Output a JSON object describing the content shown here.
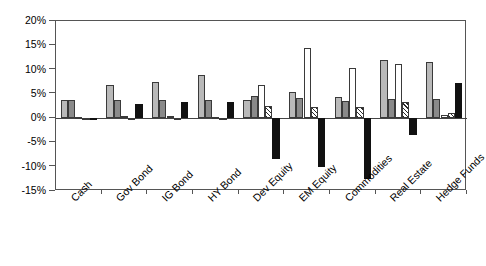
{
  "chart_data": {
    "type": "bar",
    "title": "",
    "subtitle": "",
    "xlabel": "",
    "ylabel": "",
    "ylim": [
      -15,
      20
    ],
    "ytick_values": [
      20,
      15,
      10,
      5,
      0,
      -5,
      -10,
      -15
    ],
    "ytick_labels": [
      "20%",
      "15%",
      "10%",
      "5%",
      "0%",
      "-5%",
      "-10%",
      "-15%"
    ],
    "grid": false,
    "legend": "none",
    "categories": [
      "Cash",
      "Gov Bond",
      "IG Bond",
      "HY Bond",
      "Dev Equity",
      "EM Equity",
      "Commodities",
      "Real Estate",
      "Hedge Funds"
    ],
    "series": [
      {
        "name": "series-1",
        "style": "light-gray",
        "color": "#b9b9b9",
        "values": [
          3.7,
          6.8,
          7.4,
          8.8,
          3.8,
          5.3,
          4.4,
          11.9,
          11.6
        ]
      },
      {
        "name": "series-2",
        "style": "medium-gray",
        "color": "#8a8a8a",
        "values": [
          3.7,
          3.7,
          3.7,
          3.7,
          4.6,
          4.1,
          3.6,
          4.0,
          3.9
        ]
      },
      {
        "name": "series-3",
        "style": "white",
        "color": "#ffffff",
        "values": [
          0.2,
          0.4,
          0.5,
          0.3,
          6.8,
          14.5,
          10.3,
          11.1,
          0.6
        ]
      },
      {
        "name": "series-4",
        "style": "hatched",
        "color": "#ffffff",
        "values": [
          0.1,
          0.0,
          -0.2,
          -0.2,
          2.4,
          2.2,
          2.3,
          3.4,
          1.0
        ]
      },
      {
        "name": "series-5",
        "style": "black",
        "color": "#111111",
        "values": [
          -0.2,
          2.9,
          3.4,
          3.4,
          -8.4,
          -10.1,
          -12.6,
          -3.5,
          7.3
        ]
      }
    ]
  }
}
